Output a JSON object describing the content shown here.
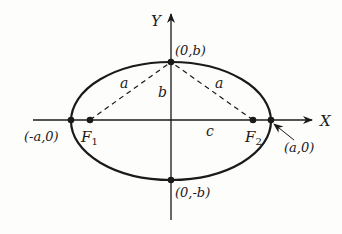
{
  "diagram": {
    "type": "ellipse-with-foci",
    "colors": {
      "ink": "#1a1a1a",
      "background": "#fdfdfc"
    },
    "axes": {
      "x_label": "X",
      "y_label": "Y"
    },
    "points": {
      "top_vertex": "(0,b)",
      "bottom_vertex": "(0,-b)",
      "left_vertex": "(-a,0)",
      "right_vertex": "(a,0)",
      "focus_left": "F",
      "focus_left_sub": "1",
      "focus_right": "F",
      "focus_right_sub": "2"
    },
    "segments": {
      "left_focal_distance": "a",
      "right_focal_distance": "a",
      "semi_minor": "b",
      "focal_half_distance": "c"
    }
  }
}
